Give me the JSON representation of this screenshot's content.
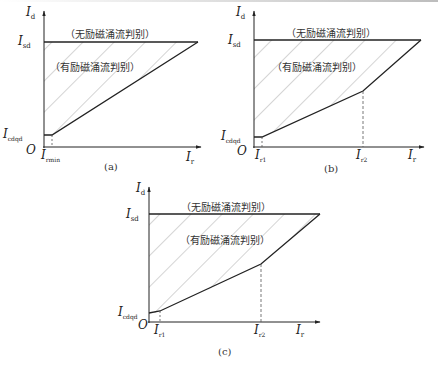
{
  "figure": {
    "panels": [
      {
        "id": "a",
        "caption": "(a)",
        "y_axis_label": "I",
        "y_axis_sub": "d",
        "x_axis_label": "I",
        "x_axis_sub": "r",
        "origin_label": "O",
        "isd_label": "I",
        "isd_sub": "sd",
        "icdqd_label": "I",
        "icdqd_sub": "cdqd",
        "x_tick1_label": "I",
        "x_tick1_sub": "rmin",
        "region_no_inrush": "（无励磁涌流判别）",
        "region_inrush": "（有励磁涌流判别）",
        "breakpoints": 1
      },
      {
        "id": "b",
        "caption": "(b)",
        "y_axis_label": "I",
        "y_axis_sub": "d",
        "x_axis_label": "I",
        "x_axis_sub": "r",
        "origin_label": "O",
        "isd_label": "I",
        "isd_sub": "sd",
        "icdqd_label": "I",
        "icdqd_sub": "cdqd",
        "x_tick1_label": "I",
        "x_tick1_sub": "r1",
        "x_tick2_label": "I",
        "x_tick2_sub": "r2",
        "region_no_inrush": "（无励磁涌流判别）",
        "region_inrush": "（有励磁涌流判别）",
        "breakpoints": 2
      },
      {
        "id": "c",
        "caption": "(c)",
        "y_axis_label": "I",
        "y_axis_sub": "d",
        "x_axis_label": "I",
        "x_axis_sub": "r",
        "origin_label": "O",
        "isd_label": "I",
        "isd_sub": "sd",
        "icdqd_label": "I",
        "icdqd_sub": "cdqd",
        "x_tick1_label": "I",
        "x_tick1_sub": "r1",
        "x_tick2_label": "I",
        "x_tick2_sub": "r2",
        "region_no_inrush": "（无励磁涌流判别）",
        "region_inrush": "（有励磁涌流判别）",
        "breakpoints": 2
      }
    ]
  },
  "colors": {
    "line": "#222222",
    "hatch": "#9a9a9a",
    "dashed": "#555555"
  }
}
